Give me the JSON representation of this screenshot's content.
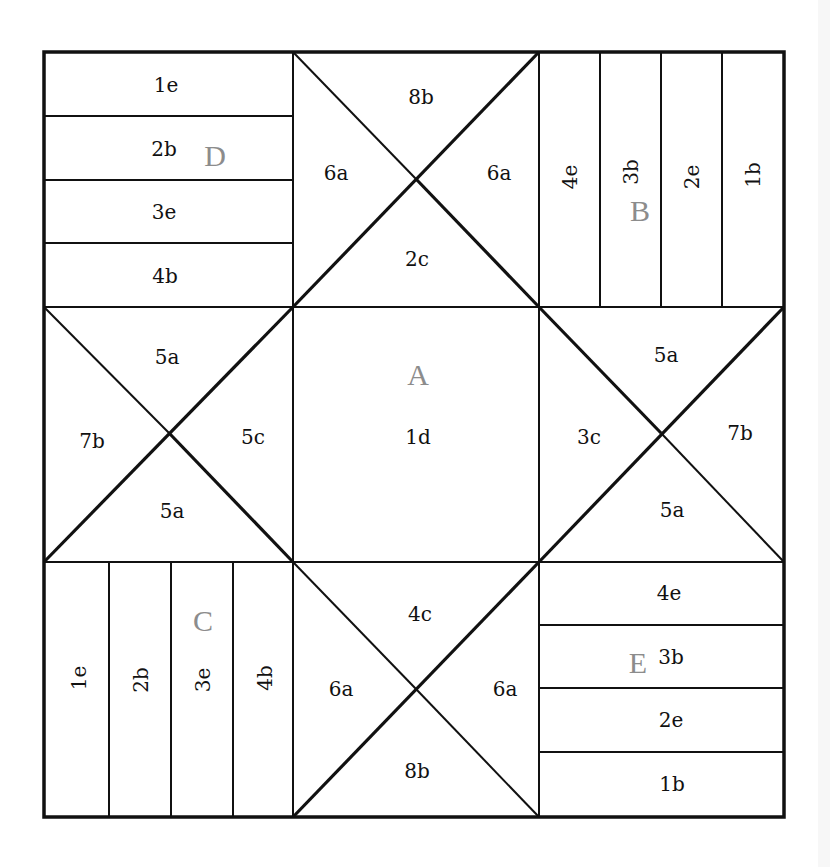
{
  "diagram": {
    "title": "",
    "colors": {
      "line": "#111111",
      "label": "#111111",
      "block_letter": "#8c8c8c",
      "background": "#ffffff"
    },
    "grid": {
      "x": [
        44,
        293,
        539,
        784
      ],
      "y": [
        52,
        307,
        562,
        817
      ]
    },
    "blocks": {
      "D": {
        "letter": "D",
        "position": "top-left",
        "type": "horizontal-strips",
        "strips": [
          "1e",
          "2b",
          "3e",
          "4b"
        ]
      },
      "top_center": {
        "position": "top-center",
        "type": "hourglass",
        "top": "8b",
        "left": "6a",
        "right": "6a",
        "bottom": "2c"
      },
      "B": {
        "letter": "B",
        "position": "top-right",
        "type": "vertical-strips",
        "strips": [
          "4e",
          "3b",
          "2e",
          "1b"
        ]
      },
      "middle_left": {
        "position": "middle-left",
        "type": "hourglass",
        "top": "5a",
        "left": "7b",
        "right": "5c",
        "bottom": "5a"
      },
      "A": {
        "letter": "A",
        "position": "center",
        "type": "square",
        "label": "1d"
      },
      "middle_right": {
        "position": "middle-right",
        "type": "hourglass",
        "top": "5a",
        "left": "3c",
        "right": "7b",
        "bottom": "5a"
      },
      "C": {
        "letter": "C",
        "position": "bottom-left",
        "type": "vertical-strips",
        "strips": [
          "1e",
          "2b",
          "3e",
          "4b"
        ]
      },
      "bottom_center": {
        "position": "bottom-center",
        "type": "hourglass",
        "top": "4c",
        "left": "6a",
        "right": "6a",
        "bottom": "8b"
      },
      "E": {
        "letter": "E",
        "position": "bottom-right",
        "type": "horizontal-strips",
        "strips": [
          "4e",
          "3b",
          "2e",
          "1b"
        ]
      }
    }
  }
}
